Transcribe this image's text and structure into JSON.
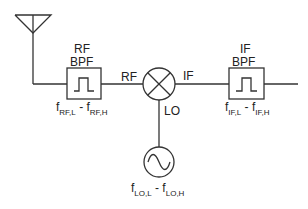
{
  "diagram": {
    "type": "superheterodyne receiver front-end block diagram",
    "colors": {
      "stroke": "#333333",
      "text": "#222222",
      "background": "#ffffff"
    },
    "blocks": {
      "antenna": {
        "icon": "antenna-icon"
      },
      "rf_filter": {
        "title_line1": "RF",
        "title_line2": "BPF",
        "icon": "bandpass-filter-icon",
        "freq_low_sym": "f",
        "freq_low_sub": "RF,L",
        "separator": " - ",
        "freq_high_sym": "f",
        "freq_high_sub": "RF,H"
      },
      "mixer": {
        "icon": "mixer-icon",
        "port_in": "RF",
        "port_out": "IF",
        "port_lo": "LO"
      },
      "local_oscillator": {
        "icon": "oscillator-icon",
        "freq_low_sym": "f",
        "freq_low_sub": "LO,L",
        "separator": " - ",
        "freq_high_sym": "f",
        "freq_high_sub": "LO,H"
      },
      "if_filter": {
        "title_line1": "IF",
        "title_line2": "BPF",
        "icon": "bandpass-filter-icon",
        "freq_low_sym": "f",
        "freq_low_sub": "IF,L",
        "separator": " - ",
        "freq_high_sym": "f",
        "freq_high_sub": "IF,H"
      }
    }
  }
}
